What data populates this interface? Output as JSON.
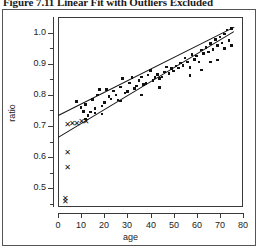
{
  "caption": {
    "text": "Figure 7.11  Linear Fit with Outliers Excluded"
  },
  "chart_data": {
    "type": "scatter",
    "title": "Figure 7.11  Linear Fit with Outliers Excluded",
    "xlabel": "age",
    "ylabel": "ratio",
    "xlim": [
      0,
      80
    ],
    "ylim": [
      0.44,
      1.05
    ],
    "xticks": [
      0,
      10,
      20,
      30,
      40,
      50,
      60,
      70,
      80
    ],
    "yticks": [
      0.5,
      0.6,
      0.7,
      0.8,
      0.9,
      1.0
    ],
    "ytick_labels": [
      "0.5",
      "0.6",
      "0.7",
      "0.8",
      "0.9",
      "1.0"
    ],
    "xtick_labels": [
      "0",
      "10",
      "20",
      "30",
      "40",
      "50",
      "60",
      "70",
      "80"
    ],
    "grid": false,
    "legend": "none",
    "series": [
      {
        "name": "included observations",
        "marker": "filled-square",
        "points": [
          [
            8,
            0.778
          ],
          [
            10,
            0.76
          ],
          [
            11,
            0.747
          ],
          [
            12,
            0.77
          ],
          [
            13,
            0.733
          ],
          [
            14,
            0.745
          ],
          [
            15,
            0.786
          ],
          [
            16,
            0.757
          ],
          [
            16,
            0.742
          ],
          [
            17,
            0.8
          ],
          [
            18,
            0.818
          ],
          [
            19,
            0.764
          ],
          [
            20,
            0.775
          ],
          [
            21,
            0.818
          ],
          [
            22,
            0.795
          ],
          [
            23,
            0.787
          ],
          [
            24,
            0.812
          ],
          [
            25,
            0.8
          ],
          [
            26,
            0.783
          ],
          [
            27,
            0.825
          ],
          [
            28,
            0.852
          ],
          [
            29,
            0.806
          ],
          [
            30,
            0.81
          ],
          [
            31,
            0.838
          ],
          [
            32,
            0.855
          ],
          [
            33,
            0.82
          ],
          [
            34,
            0.829
          ],
          [
            35,
            0.846
          ],
          [
            36,
            0.858
          ],
          [
            37,
            0.833
          ],
          [
            38,
            0.836
          ],
          [
            39,
            0.864
          ],
          [
            40,
            0.878
          ],
          [
            41,
            0.846
          ],
          [
            42,
            0.855
          ],
          [
            43,
            0.866
          ],
          [
            44,
            0.852
          ],
          [
            45,
            0.858
          ],
          [
            46,
            0.874
          ],
          [
            47,
            0.89
          ],
          [
            48,
            0.868
          ],
          [
            49,
            0.884
          ],
          [
            50,
            0.877
          ],
          [
            51,
            0.893
          ],
          [
            52,
            0.886
          ],
          [
            53,
            0.902
          ],
          [
            54,
            0.895
          ],
          [
            55,
            0.918
          ],
          [
            56,
            0.906
          ],
          [
            57,
            0.887
          ],
          [
            58,
            0.93
          ],
          [
            59,
            0.914
          ],
          [
            60,
            0.925
          ],
          [
            61,
            0.906
          ],
          [
            62,
            0.944
          ],
          [
            63,
            0.932
          ],
          [
            64,
            0.952
          ],
          [
            65,
            0.938
          ],
          [
            66,
            0.965
          ],
          [
            67,
            0.946
          ],
          [
            68,
            0.978
          ],
          [
            69,
            0.958
          ],
          [
            70,
            0.986
          ],
          [
            71,
            0.966
          ],
          [
            72,
            0.996
          ],
          [
            73,
            1.008
          ],
          [
            74,
            0.975
          ],
          [
            75,
            1.014
          ],
          [
            62,
            0.88
          ],
          [
            66,
            0.905
          ],
          [
            69,
            0.912
          ],
          [
            72,
            0.948
          ],
          [
            75,
            0.958
          ],
          [
            57,
            0.862
          ],
          [
            44,
            0.824
          ],
          [
            36,
            0.8
          ],
          [
            27,
            0.78
          ],
          [
            19,
            0.738
          ],
          [
            12,
            0.722
          ]
        ]
      },
      {
        "name": "excluded outliers",
        "marker": "cross",
        "points": [
          [
            4,
            0.703
          ],
          [
            6,
            0.707
          ],
          [
            8,
            0.707
          ],
          [
            10,
            0.713
          ],
          [
            12,
            0.713
          ],
          [
            4,
            0.612
          ],
          [
            4,
            0.565
          ],
          [
            3,
            0.467
          ],
          [
            3,
            0.457
          ]
        ]
      }
    ],
    "fit_lines": [
      {
        "name": "fit excluding outliers",
        "x": [
          0,
          76
        ],
        "y": [
          0.735,
          1.018
        ]
      },
      {
        "name": "fit including outliers",
        "x": [
          0,
          76
        ],
        "y": [
          0.665,
          1.005
        ]
      }
    ]
  }
}
